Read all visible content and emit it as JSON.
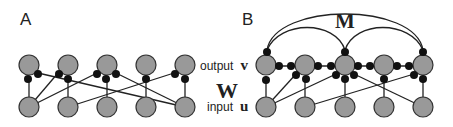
{
  "panels": {
    "A": {
      "label": "A"
    },
    "B": {
      "label": "B"
    }
  },
  "labels": {
    "output_word": "output",
    "output_symbol": "v",
    "weights_symbol": "W",
    "input_word": "input",
    "input_symbol": "u",
    "recurrent_symbol": "M"
  },
  "colors": {
    "neuron_fill": "#999999",
    "neuron_stroke": "#333333",
    "synapse": "#111111",
    "line": "#222222"
  },
  "diagram": {
    "panel_A": {
      "description": "Feedforward network: 5 input units u connected to 5 output units v via weights W",
      "output_nodes": 5,
      "input_nodes": 5,
      "feedforward_connections": [
        [
          0,
          0
        ],
        [
          0,
          1
        ],
        [
          0,
          2
        ],
        [
          1,
          1
        ],
        [
          1,
          4
        ],
        [
          2,
          2
        ],
        [
          3,
          3
        ],
        [
          4,
          4
        ],
        [
          4,
          0
        ],
        [
          4,
          2
        ]
      ]
    },
    "panel_B": {
      "description": "Recurrent network: feedforward weights W plus recurrent weights M among output units",
      "output_nodes": 5,
      "input_nodes": 5,
      "feedforward_connections": [
        [
          0,
          0
        ],
        [
          0,
          1
        ],
        [
          0,
          2
        ],
        [
          1,
          1
        ],
        [
          1,
          4
        ],
        [
          2,
          2
        ],
        [
          3,
          3
        ],
        [
          4,
          4
        ],
        [
          4,
          2
        ]
      ],
      "recurrent_arcs": [
        [
          0,
          2
        ],
        [
          2,
          4
        ],
        [
          0,
          4
        ]
      ],
      "lateral_connections": [
        [
          0,
          1
        ],
        [
          1,
          2
        ],
        [
          2,
          3
        ],
        [
          3,
          4
        ]
      ]
    }
  }
}
